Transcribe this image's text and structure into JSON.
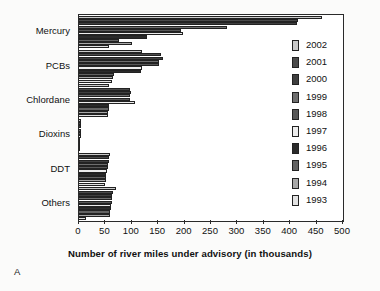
{
  "panel": {
    "letter": "A"
  },
  "chart_data": {
    "type": "bar",
    "orientation": "horizontal",
    "title": "",
    "xlabel": "Number of river miles under advisory (in thousands)",
    "ylabel": "",
    "xlim": [
      0,
      500
    ],
    "xticks": [
      0,
      50,
      100,
      150,
      200,
      250,
      300,
      350,
      400,
      450,
      500
    ],
    "xtick_labels": [
      "0",
      "50",
      "100",
      "150",
      "200",
      "250",
      "300",
      "350",
      "400",
      "450",
      "500"
    ],
    "grid": false,
    "legend_position": "right-inside",
    "categories": [
      "Mercury",
      "PCBs",
      "Chlordane",
      "Dioxins",
      "DDT",
      "Others"
    ],
    "series": [
      {
        "name": "2002",
        "color": "#c9c9c9",
        "values": [
          460,
          120,
          57,
          3,
          58,
          70
        ]
      },
      {
        "name": "2001",
        "color": "#4a4a4a",
        "values": [
          415,
          156,
          97,
          3,
          57,
          65
        ]
      },
      {
        "name": "2000",
        "color": "#3f3f3f",
        "values": [
          413,
          160,
          98,
          3,
          56,
          63
        ]
      },
      {
        "name": "1999",
        "color": "#6e6e6e",
        "values": [
          281,
          152,
          97,
          3,
          55,
          62
        ]
      },
      {
        "name": "1998",
        "color": "#575757",
        "values": [
          194,
          152,
          96,
          3,
          54,
          62
        ]
      },
      {
        "name": "1997",
        "color": "#ededed",
        "values": [
          197,
          120,
          107,
          3,
          53,
          60
        ]
      },
      {
        "name": "1996",
        "color": "#2b2b2b",
        "values": [
          128,
          118,
          57,
          2,
          52,
          60
        ]
      },
      {
        "name": "1995",
        "color": "#636363",
        "values": [
          75,
          67,
          57,
          2,
          52,
          59
        ]
      },
      {
        "name": "1994",
        "color": "#a8a8a8",
        "values": [
          100,
          65,
          55,
          2,
          51,
          59
        ]
      },
      {
        "name": "1993",
        "color": "#e2e2e2",
        "values": [
          57,
          63,
          54,
          2,
          50,
          14
        ]
      }
    ]
  }
}
